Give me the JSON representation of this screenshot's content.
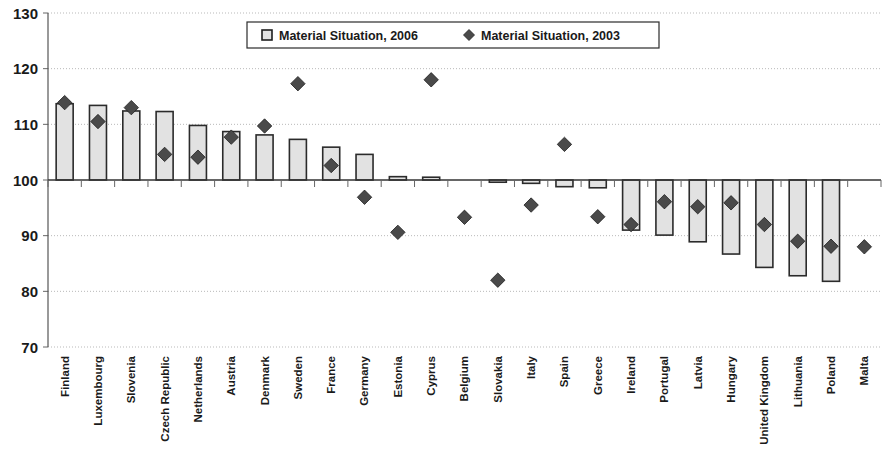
{
  "chart_data": {
    "type": "bar",
    "title": "",
    "xlabel": "",
    "ylabel": "",
    "ylim": [
      70,
      130
    ],
    "ytick_step": 10,
    "yticks": [
      70,
      80,
      90,
      100,
      110,
      120,
      130
    ],
    "grid": true,
    "baseline": 100,
    "legend_position": "top-center",
    "categories": [
      "Finland",
      "Luxembourg",
      "Slovenia",
      "Czech Republic",
      "Netherlands",
      "Austria",
      "Denmark",
      "Sweden",
      "France",
      "Germany",
      "Estonia",
      "Cyprus",
      "Belgium",
      "Slovakia",
      "Italy",
      "Spain",
      "Greece",
      "Ireland",
      "Portugal",
      "Latvia",
      "Hungary",
      "United Kingdom",
      "Lithuania",
      "Poland",
      "Malta"
    ],
    "series": [
      {
        "name": "Material Situation, 2006",
        "type": "bar",
        "values": [
          113.7,
          113.4,
          112.4,
          112.3,
          109.8,
          108.7,
          108.1,
          107.3,
          105.9,
          104.6,
          100.6,
          100.5,
          100.0,
          99.6,
          99.4,
          98.8,
          98.6,
          91.0,
          90.1,
          88.9,
          86.7,
          84.3,
          82.8,
          81.8,
          100.0
        ]
      },
      {
        "name": "Material Situation, 2003",
        "type": "scatter",
        "values": [
          113.9,
          110.5,
          113.0,
          104.6,
          104.1,
          107.7,
          109.7,
          117.3,
          102.6,
          96.9,
          90.6,
          118.0,
          93.3,
          82.0,
          95.5,
          106.4,
          93.4,
          92.0,
          96.1,
          95.2,
          95.9,
          92.0,
          89.0,
          88.1,
          88.0
        ]
      }
    ]
  },
  "legend": {
    "items": [
      {
        "label": "Material Situation, 2006",
        "marker": "square-marker"
      },
      {
        "label": "Material Situation, 2003",
        "marker": "diamond-marker"
      }
    ]
  },
  "colors": {
    "bar_fill": "#e2e2e2",
    "bar_stroke": "#2b2b2b",
    "marker_fill": "#4a4a4a",
    "grid": "#b9b9b9",
    "axis": "#555555",
    "text": "#1a1a1a",
    "background": "#ffffff"
  }
}
